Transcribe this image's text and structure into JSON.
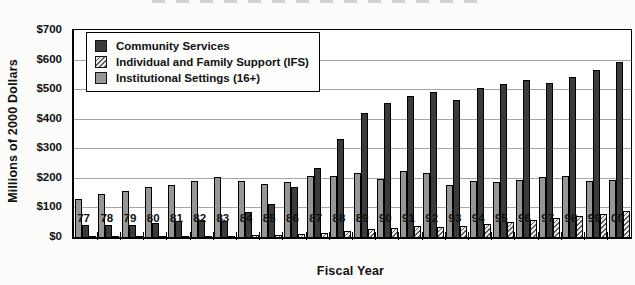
{
  "figure": {
    "y_axis_title": "Millions of 2000 Dollars",
    "x_axis_title": "Fiscal Year"
  },
  "chart_data": {
    "type": "bar",
    "title": "",
    "xlabel": "Fiscal Year",
    "ylabel": "Millions of 2000 Dollars",
    "ylim": [
      0,
      700
    ],
    "ytick_step": 100,
    "ytick_labels": [
      "$0",
      "$100",
      "$200",
      "$300",
      "$400",
      "$500",
      "$600",
      "$700"
    ],
    "grid": true,
    "legend_position": "top-left-inside",
    "categories": [
      "77",
      "78",
      "79",
      "80",
      "81",
      "82",
      "83",
      "84",
      "85",
      "86",
      "87",
      "88",
      "89",
      "90",
      "91",
      "92",
      "93",
      "94",
      "95",
      "96",
      "97",
      "98",
      "99",
      "00"
    ],
    "series": [
      {
        "name": "Community Services",
        "pattern": "solid",
        "color": "#3b3b3b",
        "values": [
          40,
          40,
          42,
          48,
          53,
          57,
          55,
          85,
          112,
          170,
          235,
          330,
          420,
          452,
          478,
          490,
          465,
          505,
          518,
          530,
          522,
          541,
          565,
          592
        ]
      },
      {
        "name": "Individual and Family Support (IFS)",
        "pattern": "diagonal-hatch",
        "color": "#ebebeb",
        "hatch_color": "#5a5a5a",
        "values": [
          2,
          2,
          3,
          3,
          4,
          4,
          5,
          6,
          7,
          10,
          15,
          22,
          28,
          30,
          38,
          35,
          36,
          45,
          52,
          58,
          64,
          72,
          78,
          88
        ]
      },
      {
        "name": "Institutional Settings (16+)",
        "pattern": "solid",
        "color": "#969696",
        "values": [
          128,
          145,
          155,
          168,
          177,
          188,
          203,
          188,
          180,
          186,
          205,
          207,
          218,
          196,
          224,
          215,
          175,
          188,
          185,
          193,
          203,
          207,
          190,
          193
        ]
      }
    ],
    "bar_draw_order": [
      2,
      0,
      1
    ],
    "style": {
      "bar_outline": "#000000",
      "grid_color": "#a6a6a6",
      "plot_border": "#000000",
      "background": "#ffffff"
    }
  }
}
